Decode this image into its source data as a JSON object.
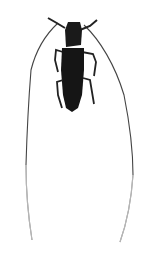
{
  "image": {
    "subject": "longhorn beetle specimen, dorsal view",
    "background_color": "#ffffff",
    "body_color": "#1a1a1a",
    "antenna_color": "#444444"
  }
}
